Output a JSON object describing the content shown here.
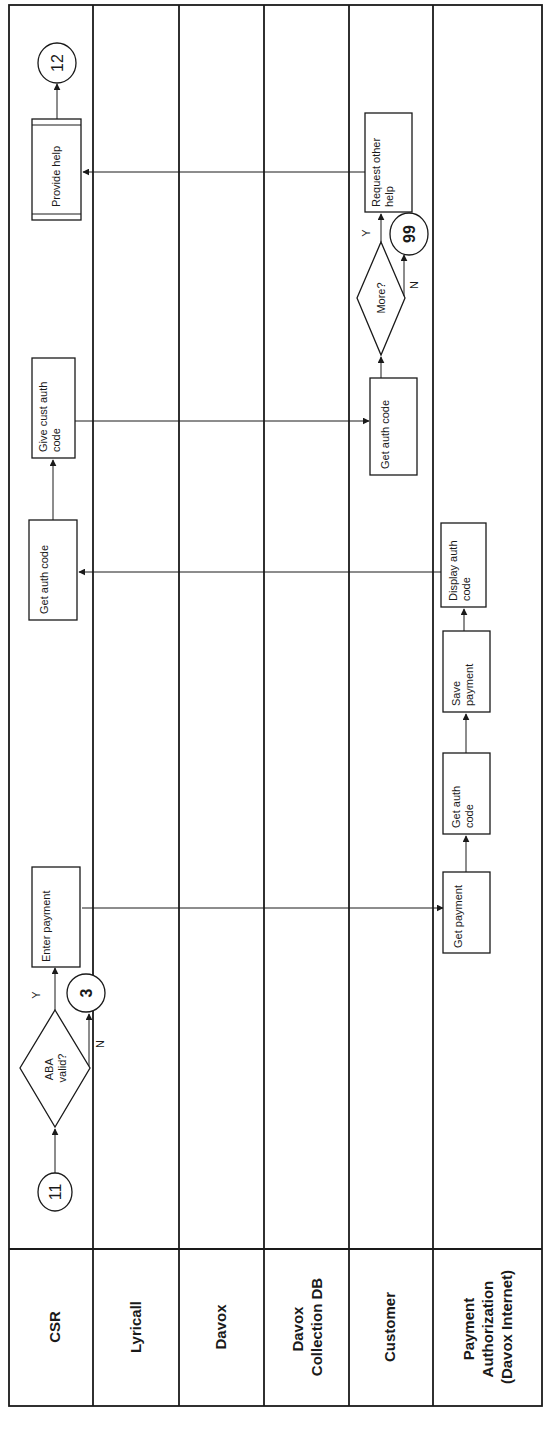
{
  "diagram": {
    "type": "swimlane-flowchart",
    "orientation": "rotated-90-ccw",
    "lanes": [
      {
        "id": "csr",
        "label_lines": [
          "CSR"
        ]
      },
      {
        "id": "lyricall",
        "label_lines": [
          "Lyricall"
        ]
      },
      {
        "id": "davox",
        "label_lines": [
          "Davox"
        ]
      },
      {
        "id": "davox-collection-db",
        "label_lines": [
          "Davox",
          "Collection DB"
        ]
      },
      {
        "id": "customer",
        "label_lines": [
          "Customer"
        ]
      },
      {
        "id": "payment-authorization",
        "label_lines": [
          "Payment",
          "Authorization",
          "(Davox Internet)"
        ]
      }
    ],
    "connectors": {
      "c11": "11",
      "c3": "3",
      "c99": "99",
      "c12": "12"
    },
    "nodes": {
      "aba_valid": [
        "ABA",
        "valid?"
      ],
      "enter_payment": [
        "Enter  payment"
      ],
      "get_payment": [
        "Get payment"
      ],
      "pa_get_auth_code": [
        "Get auth",
        "code"
      ],
      "save_payment": [
        "Save",
        "payment"
      ],
      "display_auth_code": [
        "Display auth",
        "code"
      ],
      "csr_get_auth_code": [
        "Get auth code"
      ],
      "give_cust_auth_code": [
        "Give cust  auth",
        "code"
      ],
      "cust_get_auth_code": [
        "Get auth code"
      ],
      "more": [
        "More?"
      ],
      "request_other_help": [
        "Request other",
        "help"
      ],
      "provide_help": [
        "Provide help"
      ]
    },
    "branch_labels": {
      "aba_yes": "Y",
      "aba_no": "N",
      "more_yes": "Y",
      "more_no": "N"
    },
    "edges": [
      {
        "from": "11",
        "to": "ABA valid?"
      },
      {
        "from": "ABA valid?",
        "to": "Enter payment",
        "label": "Y"
      },
      {
        "from": "ABA valid?",
        "to": "3",
        "label": "N"
      },
      {
        "from": "Enter payment",
        "to": "Get payment"
      },
      {
        "from": "Get payment",
        "to": "Get auth code (Payment Authorization)"
      },
      {
        "from": "Get auth code (Payment Authorization)",
        "to": "Save payment"
      },
      {
        "from": "Save payment",
        "to": "Display auth code"
      },
      {
        "from": "Display auth code",
        "to": "Get auth code (CSR)"
      },
      {
        "from": "Get auth code (CSR)",
        "to": "Give cust auth code"
      },
      {
        "from": "Give cust auth code",
        "to": "Get auth code (Customer)"
      },
      {
        "from": "Get auth code (Customer)",
        "to": "More?"
      },
      {
        "from": "More?",
        "to": "Request other help",
        "label": "Y"
      },
      {
        "from": "More?",
        "to": "99",
        "label": "N"
      },
      {
        "from": "Request other help",
        "to": "Provide help"
      },
      {
        "from": "Provide help",
        "to": "12"
      }
    ]
  }
}
